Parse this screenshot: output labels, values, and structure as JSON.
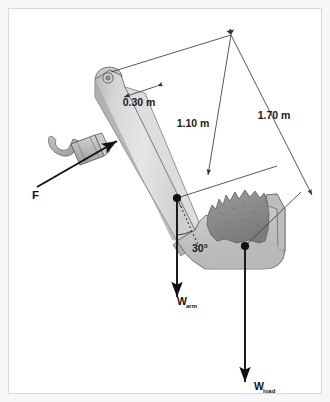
{
  "figure": {
    "background_color": "#f7f7f7",
    "panel_color": "#ffffff",
    "border_color": "#d8d8d8"
  },
  "dimensions": [
    {
      "id": "d030",
      "label": "0.30 m",
      "x": 130,
      "y": 97
    },
    {
      "id": "d110",
      "label": "1.10 m",
      "x": 184,
      "y": 118
    },
    {
      "id": "d170",
      "label": "1.70 m",
      "x": 265,
      "y": 110
    }
  ],
  "angles": [
    {
      "id": "a30",
      "label": "30°",
      "x": 183,
      "y": 243
    }
  ],
  "vectors": [
    {
      "id": "force-f",
      "label": "F",
      "sub": "",
      "label_x": 23,
      "label_y": 190,
      "color": "#111111"
    },
    {
      "id": "weight-arm",
      "label": "W",
      "sub": "arm",
      "label_x": 168,
      "label_y": 296,
      "color": "#111111"
    },
    {
      "id": "weight-load",
      "label": "W",
      "sub": "load",
      "label_x": 245,
      "label_y": 381,
      "color": "#111111"
    }
  ],
  "colors": {
    "line": "#3a3a3a",
    "arm_light": "#e9e9e9",
    "arm_mid": "#d2d2d2",
    "arm_dark": "#a8a8a8",
    "bucket_fill": "#c9c9c9",
    "load_fill": "#8e8e8e",
    "cylinder_fill": "#bdbdbd",
    "vector": "#111111"
  }
}
